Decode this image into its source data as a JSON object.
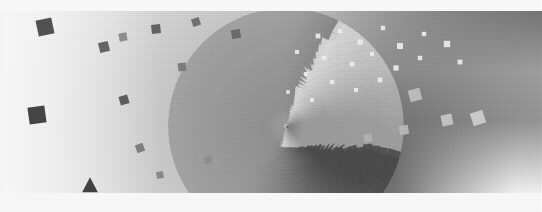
{
  "artwork": {
    "title": "Radial Halftone Vortex",
    "medium": "generative-raster",
    "width": 542,
    "height": 212,
    "background_color": "#ffffff",
    "paper_color": "#fdfdfd"
  },
  "canvas": {
    "label": "vortex-render-surface",
    "width": 542,
    "height": 212
  },
  "margins": {
    "top": {
      "label": "top-paper-band",
      "y": 0,
      "height": 11,
      "color": "#fdfdfd"
    },
    "bottom": {
      "label": "bottom-paper-band",
      "y": 193,
      "height": 19,
      "color": "#fdfdfd"
    }
  },
  "chart_data": {
    "type": "scatter",
    "xlabel": "",
    "ylabel": "",
    "xlim": [
      0,
      542
    ],
    "ylim": [
      0,
      212
    ],
    "grid": false,
    "legend": "none",
    "projection": "log-polar spiral tiling",
    "vortex_center": {
      "x": 286,
      "y": 126
    },
    "ring_count": 46,
    "spokes_per_ring": 104,
    "ring_growth": 1.082,
    "ring_inner_radius": 3.2,
    "spiral_twist_per_ring": 0.0585,
    "tile_shape": "rotated-square",
    "tile_size_ratio": 0.52,
    "tonal_field": {
      "description": "Luminance of each tile is driven by a smooth angular+radial gradient: dark gray band sweeping from upper-right through center, fading to near-white toward the left and lower-right.",
      "dark_lobe_angle_deg": 18,
      "dark_lobe_spread_deg": 118,
      "min_luminance": 96,
      "max_luminance": 253,
      "polarity_flip_radius": 150,
      "polarity_note": "Beyond the flip radius on the upper-right the tiles render lighter than the field (white squares on gray); elsewhere tiles render darker than the field (gray squares on white)."
    },
    "field_gradient_stops": [
      {
        "position": 0.0,
        "color": "#b4b4b4",
        "note": "vortex core haze"
      },
      {
        "position": 0.28,
        "color": "#a6a6a6",
        "note": "inner dark band"
      },
      {
        "position": 0.55,
        "color": "#c9c9c9",
        "note": "mid falloff"
      },
      {
        "position": 0.8,
        "color": "#ececec",
        "note": "outer falloff"
      },
      {
        "position": 1.0,
        "color": "#fcfcfc",
        "note": "paper white"
      }
    ],
    "upper_right_band": {
      "color": "#a8a8a8",
      "x_range": [
        300,
        542
      ],
      "y_range": [
        11,
        70
      ],
      "speck_color": "#f2f2f2",
      "speck_count": 34
    },
    "accent_markers": [
      {
        "name": "marker-square-1",
        "shape": "square",
        "x": 45,
        "y": 27,
        "size": 16,
        "rotation": -12,
        "color": "#4a4a4a"
      },
      {
        "name": "marker-square-2",
        "shape": "square",
        "x": 37,
        "y": 115,
        "size": 17,
        "rotation": -8,
        "color": "#3d3d3d"
      },
      {
        "name": "marker-square-3",
        "shape": "square",
        "x": 104,
        "y": 47,
        "size": 10,
        "rotation": -14,
        "color": "#606060"
      },
      {
        "name": "marker-square-4",
        "shape": "square",
        "x": 123,
        "y": 37,
        "size": 8,
        "rotation": -10,
        "color": "#8c8c8c"
      },
      {
        "name": "marker-square-5",
        "shape": "square",
        "x": 124,
        "y": 100,
        "size": 9,
        "rotation": -16,
        "color": "#5a5a5a"
      },
      {
        "name": "marker-square-6",
        "shape": "square",
        "x": 156,
        "y": 29,
        "size": 9,
        "rotation": -6,
        "color": "#5f5f5f"
      },
      {
        "name": "marker-square-7",
        "shape": "square",
        "x": 196,
        "y": 22,
        "size": 8,
        "rotation": -18,
        "color": "#6e6e6e"
      },
      {
        "name": "marker-square-8",
        "shape": "square",
        "x": 182,
        "y": 67,
        "size": 8,
        "rotation": -8,
        "color": "#7a7a7a"
      },
      {
        "name": "marker-square-9",
        "shape": "square",
        "x": 236,
        "y": 34,
        "size": 9,
        "rotation": -12,
        "color": "#6a6a6a"
      },
      {
        "name": "marker-square-10",
        "shape": "square",
        "x": 140,
        "y": 148,
        "size": 8,
        "rotation": -20,
        "color": "#7d7d7d"
      },
      {
        "name": "marker-square-11",
        "shape": "square",
        "x": 160,
        "y": 175,
        "size": 7,
        "rotation": -10,
        "color": "#8a8a8a"
      },
      {
        "name": "marker-square-12",
        "shape": "square",
        "x": 208,
        "y": 160,
        "size": 7,
        "rotation": -14,
        "color": "#8f8f8f"
      },
      {
        "name": "marker-square-13",
        "shape": "square",
        "x": 415,
        "y": 95,
        "size": 12,
        "rotation": -15,
        "color": "#c2c2c2"
      },
      {
        "name": "marker-square-14",
        "shape": "square",
        "x": 447,
        "y": 120,
        "size": 11,
        "rotation": -12,
        "color": "#c9c9c9"
      },
      {
        "name": "marker-square-15",
        "shape": "square",
        "x": 478,
        "y": 118,
        "size": 13,
        "rotation": -18,
        "color": "#d2d2d2"
      },
      {
        "name": "marker-square-16",
        "shape": "square",
        "x": 404,
        "y": 130,
        "size": 9,
        "rotation": -9,
        "color": "#bdbdbd"
      },
      {
        "name": "marker-square-17",
        "shape": "square",
        "x": 368,
        "y": 138,
        "size": 8,
        "rotation": -12,
        "color": "#b5b5b5"
      },
      {
        "name": "marker-triangle-1",
        "shape": "triangle",
        "x": 90,
        "y": 186,
        "size": 14,
        "rotation": 0,
        "color": "#3a3a3a"
      }
    ],
    "white_specks": [
      {
        "x": 318,
        "y": 36,
        "r": 2.4
      },
      {
        "x": 340,
        "y": 31,
        "r": 2.0
      },
      {
        "x": 360,
        "y": 42,
        "r": 2.6
      },
      {
        "x": 383,
        "y": 28,
        "r": 2.2
      },
      {
        "x": 400,
        "y": 46,
        "r": 3.0
      },
      {
        "x": 424,
        "y": 34,
        "r": 2.2
      },
      {
        "x": 447,
        "y": 44,
        "r": 3.2
      },
      {
        "x": 297,
        "y": 52,
        "r": 2.0
      },
      {
        "x": 324,
        "y": 58,
        "r": 2.4
      },
      {
        "x": 352,
        "y": 64,
        "r": 2.2
      },
      {
        "x": 372,
        "y": 54,
        "r": 2.0
      },
      {
        "x": 396,
        "y": 68,
        "r": 2.6
      },
      {
        "x": 420,
        "y": 58,
        "r": 2.2
      },
      {
        "x": 460,
        "y": 62,
        "r": 2.4
      },
      {
        "x": 306,
        "y": 74,
        "r": 2.0
      },
      {
        "x": 332,
        "y": 82,
        "r": 2.2
      },
      {
        "x": 356,
        "y": 90,
        "r": 2.0
      },
      {
        "x": 380,
        "y": 80,
        "r": 2.4
      },
      {
        "x": 288,
        "y": 92,
        "r": 1.8
      },
      {
        "x": 312,
        "y": 100,
        "r": 2.0
      }
    ]
  }
}
